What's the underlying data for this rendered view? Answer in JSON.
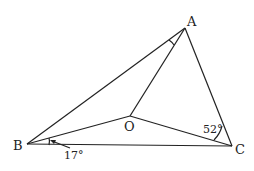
{
  "diagram": {
    "points": {
      "A": {
        "label": "A",
        "x": 185,
        "y": 28
      },
      "B": {
        "label": "B",
        "x": 27,
        "y": 144
      },
      "C": {
        "label": "C",
        "x": 232,
        "y": 146
      },
      "O": {
        "label": "O",
        "x": 130,
        "y": 116
      }
    },
    "segments": [
      "AB",
      "AC",
      "BC",
      "OA",
      "OB",
      "OC"
    ],
    "angles": {
      "OBC": {
        "label": "17°"
      },
      "OCA": {
        "label": "52°"
      },
      "BAO": {
        "label": ""
      }
    },
    "line_color": "#222222"
  }
}
